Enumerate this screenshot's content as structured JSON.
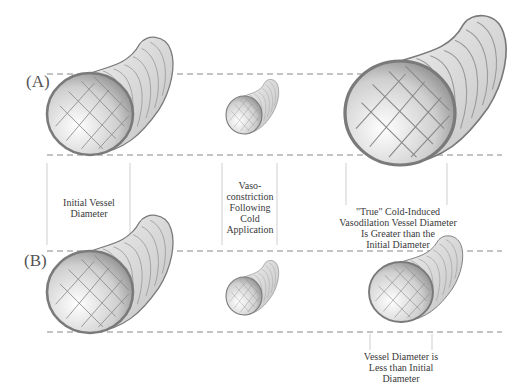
{
  "panels": {
    "a": {
      "label": "(A)"
    },
    "b": {
      "label": "(B)"
    }
  },
  "captions": {
    "initial": [
      "Initial Vessel",
      "Diameter"
    ],
    "vasoconstriction": [
      "Vaso-",
      "constriction",
      "Following",
      "Cold",
      "Application"
    ],
    "true_civd": [
      "\"True\" Cold-Induced",
      "Vasodilation Vessel Diameter",
      "Is Greater than the",
      "Initial Diameter"
    ],
    "less_than": [
      "Vessel Diameter is",
      "Less than Initial",
      "Diameter"
    ]
  },
  "vessels": [
    {
      "id": "A-initial",
      "row": "A",
      "size": "large"
    },
    {
      "id": "A-constricted",
      "row": "A",
      "size": "small"
    },
    {
      "id": "A-dilated",
      "row": "A",
      "size": "larger"
    },
    {
      "id": "B-initial",
      "row": "B",
      "size": "large"
    },
    {
      "id": "B-constricted",
      "row": "B",
      "size": "small"
    },
    {
      "id": "B-partial",
      "row": "B",
      "size": "medium"
    }
  ],
  "colors": {
    "outline": "#7a7a7a",
    "body": "#d9d9d9",
    "dash": "#888888"
  }
}
